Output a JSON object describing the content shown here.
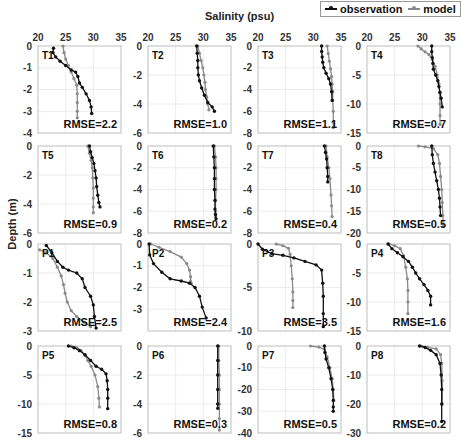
{
  "figure": {
    "x_axis_title": "Salinity (psu)",
    "y_axis_title": "Depth (m)",
    "legend": [
      {
        "label": "observation",
        "color": "#111111"
      },
      {
        "label": "model",
        "color": "#8a8a8a"
      }
    ]
  },
  "chart_data": {
    "type": "line",
    "title": "",
    "xlabel": "Salinity (psu)",
    "ylabel": "Depth (m)",
    "legend_position": "top-right",
    "grid": true,
    "xlim": [
      20,
      35
    ],
    "xticks": [
      20,
      25,
      30,
      35
    ],
    "panels": [
      {
        "name": "T1",
        "rmse": "RMSE=2.2",
        "ylim": [
          -4,
          0
        ],
        "yticks": [
          0,
          -1,
          -2,
          -3,
          -4
        ],
        "observation": {
          "x": [
            22.8,
            22.7,
            23.2,
            24.0,
            25.0,
            26.0,
            26.8,
            27.2,
            27.5,
            28.0,
            28.7,
            29.3,
            29.6,
            29.7
          ],
          "y": [
            -0.1,
            -0.3,
            -0.5,
            -0.7,
            -0.9,
            -1.1,
            -1.2,
            -1.4,
            -1.7,
            -1.9,
            -2.2,
            -2.5,
            -2.8,
            -3.1
          ]
        },
        "model": {
          "x": [
            24.5,
            24.7,
            25.0,
            25.5,
            26.0,
            26.5,
            27.0,
            27.1,
            27.1,
            27.1,
            27.1
          ],
          "y": [
            0.0,
            -0.3,
            -0.6,
            -0.9,
            -1.2,
            -1.5,
            -1.8,
            -2.2,
            -2.6,
            -3.0,
            -3.3
          ]
        }
      },
      {
        "name": "T2",
        "rmse": "RMSE=1.0",
        "ylim": [
          -6,
          0
        ],
        "yticks": [
          0,
          -2,
          -4,
          -6
        ],
        "observation": {
          "x": [
            28.8,
            28.9,
            29.0,
            29.0,
            29.1,
            29.3,
            29.7,
            30.2,
            30.8,
            31.6,
            32.0
          ],
          "y": [
            0,
            -0.5,
            -1.0,
            -1.5,
            -2.0,
            -2.4,
            -2.9,
            -3.4,
            -3.9,
            -4.2,
            -4.5
          ]
        },
        "model": {
          "x": [
            29.0,
            29.3,
            29.6,
            29.9,
            30.1,
            30.3,
            30.4,
            30.6,
            30.8,
            31.0
          ],
          "y": [
            0,
            -0.5,
            -1.0,
            -1.5,
            -2.0,
            -2.5,
            -3.0,
            -3.5,
            -4.0,
            -4.4
          ]
        }
      },
      {
        "name": "T3",
        "rmse": "RMSE=1.1",
        "ylim": [
          -8,
          0
        ],
        "yticks": [
          0,
          -2,
          -4,
          -6,
          -8
        ],
        "observation": {
          "x": [
            31.5,
            31.5,
            31.6,
            31.7,
            31.9,
            32.3,
            32.8,
            33.1,
            33.3,
            33.4
          ],
          "y": [
            0,
            -0.5,
            -1.0,
            -1.5,
            -2.0,
            -2.5,
            -3.0,
            -3.5,
            -4.2,
            -5.0
          ]
        },
        "model": {
          "x": [
            32.5,
            32.7,
            32.9,
            33.1,
            33.3,
            33.4,
            33.5,
            33.5,
            33.6,
            33.6,
            33.6
          ],
          "y": [
            0,
            -0.7,
            -1.4,
            -2.1,
            -2.8,
            -3.5,
            -4.2,
            -5.0,
            -6.0,
            -7.0,
            -7.5
          ]
        }
      },
      {
        "name": "T4",
        "rmse": "RMSE=0.7",
        "ylim": [
          -15,
          0
        ],
        "yticks": [
          0,
          -5,
          -10,
          -15
        ],
        "observation": {
          "x": [
            31.7,
            31.7,
            31.8,
            31.9,
            32.0,
            32.4,
            32.8,
            33.0,
            33.2,
            33.4,
            33.6
          ],
          "y": [
            0,
            -1,
            -2,
            -3,
            -4,
            -5,
            -6,
            -7,
            -8,
            -9,
            -10.5
          ]
        },
        "model": {
          "x": [
            29.2,
            29.8,
            30.5,
            31.2,
            31.8,
            32.3,
            32.7,
            33.0,
            33.1,
            33.2,
            33.2,
            33.2
          ],
          "y": [
            0,
            -0.5,
            -1.0,
            -1.5,
            -2.3,
            -3.5,
            -5,
            -6.5,
            -8,
            -10,
            -12,
            -13.5
          ]
        }
      },
      {
        "name": "T5",
        "rmse": "RMSE=0.9",
        "ylim": [
          -6,
          0
        ],
        "yticks": [
          0,
          -2,
          -4,
          -6
        ],
        "observation": {
          "x": [
            29.3,
            29.5,
            29.8,
            30.1,
            30.3,
            30.5,
            30.6,
            30.8,
            31.0,
            31.2
          ],
          "y": [
            0,
            -0.4,
            -0.8,
            -1.2,
            -1.7,
            -2.2,
            -2.8,
            -3.4,
            -3.9,
            -4.2
          ]
        },
        "model": {
          "x": [
            29.0,
            29.3,
            29.6,
            29.8,
            29.9,
            30.0,
            30.0,
            30.0,
            30.0
          ],
          "y": [
            0,
            -0.5,
            -1.0,
            -1.5,
            -2.2,
            -2.9,
            -3.6,
            -4.2,
            -4.6
          ]
        }
      },
      {
        "name": "T6",
        "rmse": "RMSE=0.2",
        "ylim": [
          -8,
          0
        ],
        "yticks": [
          0,
          -2,
          -4,
          -6,
          -8
        ],
        "observation": {
          "x": [
            31.8,
            31.9,
            32.0,
            32.0,
            32.0,
            32.1,
            32.1,
            32.2,
            32.3
          ],
          "y": [
            0,
            -1,
            -2,
            -3,
            -4,
            -5,
            -5.8,
            -6.3,
            -6.7
          ]
        },
        "model": {
          "x": [
            32.0,
            32.2,
            32.3,
            32.3,
            32.3,
            32.2,
            32.2,
            32.2
          ],
          "y": [
            0,
            -1,
            -2,
            -3,
            -4,
            -5,
            -6,
            -6.5
          ]
        }
      },
      {
        "name": "T7",
        "rmse": "RMSE=0.4",
        "ylim": [
          -8,
          0
        ],
        "yticks": [
          0,
          -2,
          -4,
          -6,
          -8
        ],
        "observation": {
          "x": [
            32.0,
            32.2,
            32.4,
            32.5,
            32.6,
            32.6
          ],
          "y": [
            0,
            -0.6,
            -1.2,
            -2.0,
            -2.8,
            -3.3
          ]
        },
        "model": {
          "x": [
            32.3,
            32.5,
            32.8,
            33.0,
            33.2,
            33.3,
            33.4
          ],
          "y": [
            0,
            -1,
            -2,
            -3,
            -4.5,
            -5.5,
            -6.5
          ]
        }
      },
      {
        "name": "T8",
        "rmse": "RMSE=0.5",
        "ylim": [
          -20,
          0
        ],
        "yticks": [
          0,
          -5,
          -10,
          -15,
          -20
        ],
        "observation": {
          "x": [
            31.7,
            31.8,
            32.0,
            32.3,
            32.6,
            32.9,
            33.1,
            33.2,
            33.3
          ],
          "y": [
            0,
            -2,
            -4,
            -6,
            -8,
            -10,
            -12,
            -14,
            -16
          ]
        },
        "model": {
          "x": [
            29.3,
            30.5,
            32.0,
            32.8,
            33.1,
            33.3,
            33.5,
            33.6,
            33.7,
            33.8
          ],
          "y": [
            0,
            -0.2,
            -0.6,
            -2,
            -4,
            -7,
            -10,
            -13,
            -16,
            -18.5
          ]
        }
      },
      {
        "name": "P1",
        "rmse": "RMSE=2.5",
        "ylim": [
          -3,
          0
        ],
        "yticks": [
          0,
          -1,
          -2,
          -3
        ],
        "observation": {
          "x": [
            21.5,
            22.5,
            23.5,
            24.5,
            25.5,
            27.0,
            28.0,
            28.5,
            29.5,
            30.0,
            30.2,
            30.5
          ],
          "y": [
            -0.05,
            -0.3,
            -0.6,
            -0.8,
            -0.9,
            -1.0,
            -1.2,
            -1.5,
            -1.8,
            -2.1,
            -2.5,
            -2.9
          ]
        },
        "model": {
          "x": [
            20.3,
            21.5,
            22.7,
            23.5,
            24.2,
            24.6,
            24.9,
            25.3,
            26.0,
            27.0,
            28.3,
            29.5
          ],
          "y": [
            -0.2,
            -0.3,
            -0.5,
            -0.8,
            -1.1,
            -1.4,
            -1.7,
            -2.0,
            -2.3,
            -2.5,
            -2.7,
            -2.85
          ]
        }
      },
      {
        "name": "P2",
        "rmse": "RMSE=2.4",
        "ylim": [
          -4,
          0
        ],
        "yticks": [
          0,
          -1,
          -2,
          -3
        ],
        "observation": {
          "x": [
            20.2,
            20.3,
            21.0,
            22.5,
            24.0,
            26.0,
            27.5,
            28.5,
            29.3,
            29.8,
            30.5
          ],
          "y": [
            0,
            -0.5,
            -0.9,
            -1.3,
            -1.6,
            -1.7,
            -1.8,
            -2.0,
            -2.4,
            -2.9,
            -3.4
          ]
        },
        "model": {
          "x": [
            20.5,
            22.0,
            24.0,
            26.0,
            27.0,
            27.5,
            27.7,
            27.7,
            27.8
          ],
          "y": [
            0,
            -0.15,
            -0.35,
            -0.6,
            -0.9,
            -1.2,
            -1.5,
            -1.7,
            -1.8
          ]
        }
      },
      {
        "name": "P3",
        "rmse": "RMSE=3.5",
        "ylim": [
          -10,
          0
        ],
        "yticks": [
          0,
          -5,
          -10
        ],
        "observation": {
          "x": [
            20.0,
            20.8,
            22.5,
            24.5,
            26.5,
            28.5,
            30.5,
            31.5,
            31.7,
            31.8,
            31.8,
            31.8
          ],
          "y": [
            0,
            -0.6,
            -1.1,
            -1.3,
            -1.6,
            -2.0,
            -2.4,
            -3.0,
            -4.5,
            -6.0,
            -8.0,
            -9.5
          ]
        },
        "model": {
          "x": [
            23.3,
            24.5,
            25.5,
            25.8,
            26.0,
            26.2,
            26.3,
            26.3,
            26.3
          ],
          "y": [
            0,
            -0.2,
            -0.5,
            -1.2,
            -2.5,
            -4,
            -5.5,
            -6.5,
            -7.3
          ]
        }
      },
      {
        "name": "P4",
        "rmse": "RMSE=1.6",
        "ylim": [
          -15,
          0
        ],
        "yticks": [
          0,
          -5,
          -10,
          -15
        ],
        "observation": {
          "x": [
            23.8,
            24.5,
            25.5,
            26.5,
            27.5,
            28.2,
            28.8,
            29.5,
            30.3,
            31.0,
            31.5,
            31.5
          ],
          "y": [
            0,
            -0.8,
            -1.5,
            -2.2,
            -3.0,
            -4.0,
            -5.0,
            -6.0,
            -7.0,
            -8.0,
            -9.0,
            -10.5
          ]
        },
        "model": {
          "x": [
            24.0,
            25.0,
            26.0,
            26.6,
            27.0,
            27.3,
            27.4,
            27.4,
            27.4
          ],
          "y": [
            0,
            -0.3,
            -0.8,
            -2.0,
            -4.0,
            -6.0,
            -8.0,
            -10.0,
            -12.0
          ]
        }
      },
      {
        "name": "P5",
        "rmse": "RMSE=0.8",
        "ylim": [
          -15,
          0
        ],
        "yticks": [
          0,
          -5,
          -10,
          -15
        ],
        "observation": {
          "x": [
            25.5,
            26.5,
            27.5,
            28.5,
            29.5,
            30.5,
            31.5,
            32.3,
            32.5,
            32.6,
            32.6,
            32.6
          ],
          "y": [
            0,
            -0.3,
            -0.8,
            -1.5,
            -2.5,
            -3.5,
            -4.0,
            -4.8,
            -6.0,
            -7.5,
            -9.0,
            -10.8
          ]
        },
        "model": {
          "x": [
            26.0,
            27.0,
            27.8,
            28.5,
            29.0,
            29.6,
            30.3,
            30.8,
            31.0,
            31.1
          ],
          "y": [
            0,
            -0.3,
            -0.8,
            -1.6,
            -2.5,
            -3.5,
            -5,
            -7,
            -9,
            -10.5
          ]
        }
      },
      {
        "name": "P6",
        "rmse": "RMSE=0.3",
        "ylim": [
          -6,
          0
        ],
        "yticks": [
          0,
          -2,
          -4,
          -6
        ],
        "observation": {
          "x": [
            32.6,
            32.6,
            32.6,
            32.6,
            32.6,
            32.6
          ],
          "y": [
            0,
            -1,
            -2,
            -3,
            -4,
            -4.3
          ]
        },
        "model": {
          "x": [
            32.8,
            32.8,
            32.9,
            32.9,
            32.9,
            32.9,
            32.9
          ],
          "y": [
            0,
            -1,
            -2,
            -3,
            -4,
            -5,
            -5.8
          ]
        }
      },
      {
        "name": "P7",
        "rmse": "RMSE=0.5",
        "ylim": [
          -40,
          0
        ],
        "yticks": [
          0,
          -10,
          -20,
          -30,
          -40
        ],
        "observation": {
          "x": [
            32.0,
            32.1,
            32.3,
            32.8,
            33.2,
            33.5,
            33.6,
            33.6,
            33.6
          ],
          "y": [
            0,
            -3,
            -6,
            -10,
            -15,
            -20,
            -25,
            -28,
            -30
          ]
        },
        "model": {
          "x": [
            29.5,
            31.0,
            32.0,
            32.5,
            33.0,
            33.4,
            33.6,
            33.7
          ],
          "y": [
            0,
            -0.5,
            -1.5,
            -5,
            -10,
            -15,
            -20,
            -25
          ]
        }
      },
      {
        "name": "P8",
        "rmse": "RMSE=0.2",
        "ylim": [
          -30,
          0
        ],
        "yticks": [
          0,
          -10,
          -20,
          -30
        ],
        "observation": {
          "x": [
            29.5,
            30.5,
            31.5,
            32.5,
            33.2,
            33.4,
            33.5,
            33.5,
            33.5
          ],
          "y": [
            0,
            -0.5,
            -1.5,
            -3,
            -6,
            -10,
            -15,
            -20,
            -26
          ]
        },
        "model": {
          "x": [
            29.8,
            31.0,
            32.5,
            33.3,
            33.5,
            33.6,
            33.6
          ],
          "y": [
            0,
            -0.5,
            -1,
            -3,
            -6,
            -12,
            -20
          ]
        }
      }
    ]
  }
}
